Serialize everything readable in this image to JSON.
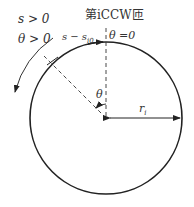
{
  "diagram": {
    "title": "第iCCW匝",
    "labels": {
      "s_positive": "s > 0",
      "theta_positive": "θ > 0",
      "s_minus": "s − s",
      "s_minus_sub": "i0",
      "theta_zero": "θ =0",
      "theta": "θ",
      "radius": "r",
      "radius_sub": "i"
    },
    "geometry": {
      "center": [
        106,
        118
      ],
      "radius": 76,
      "radial_angle_deg_from_vertical": 45
    },
    "colors": {
      "stroke": "#222222",
      "text": "#333333"
    }
  }
}
